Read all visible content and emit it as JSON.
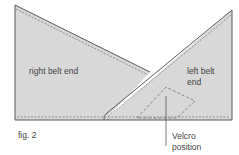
{
  "figure": {
    "caption": "fig. 2",
    "colors": {
      "fill": "#d8d8d8",
      "outline": "#5a5a5a",
      "dash": "#707070",
      "text": "#444444",
      "background": "#ffffff"
    }
  },
  "labels": {
    "right_belt_end": "right belt end",
    "left_belt_line1": "left belt",
    "left_belt_line2": "end",
    "velcro_line1": "Velcro",
    "velcro_line2": "position"
  }
}
